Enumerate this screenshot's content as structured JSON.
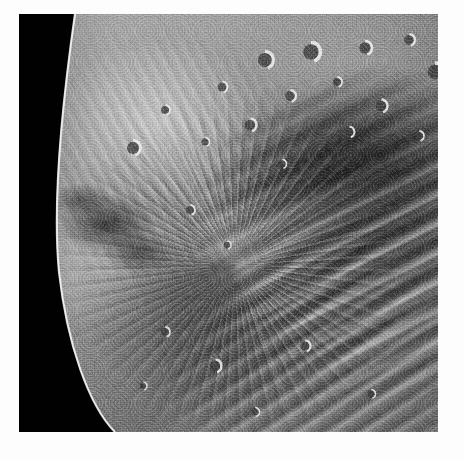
{
  "image": {
    "kind": "natural-image",
    "subject": "Planetary moon surface close-up (grayscale spacecraft photograph)",
    "body_name": "Miranda",
    "caption": "",
    "palette": {
      "space_black": "#080808",
      "terrain_dark": "#2a2a2a",
      "terrain_mid": "#7d7d7d",
      "terrain_light": "#d2d2d2",
      "highlight_white": "#f2f2f2",
      "paper_white": "#fdfdfd"
    },
    "frame": {
      "canvas_width": 464,
      "canvas_height": 460,
      "photo_left": 19,
      "photo_top": 14,
      "photo_width": 419,
      "photo_height": 418,
      "border_color": "#fdfdfd"
    },
    "features": [
      {
        "name": "terminator-limb",
        "description": "Curved bright limb separating sunlit surface from black space along the left edge"
      },
      {
        "name": "cratered-plains",
        "description": "Mottled grey cratered terrain occupying the upper-left and upper-centre"
      },
      {
        "name": "crater-field",
        "description": "Dense field of small bright-rimmed impact craters in the upper-right"
      },
      {
        "name": "chevron-apex",
        "description": "Radial convergence point of grooves and ridges near image centre"
      },
      {
        "name": "grooved-banded-terrain",
        "description": "Alternating dark and bright parallel ridge bands running diagonally across the right and lower-right"
      },
      {
        "name": "bright-band",
        "description": "Prominent bright sweeping band crossing the right side below centre"
      },
      {
        "name": "dark-rubble-patch",
        "description": "Dark broken blocky material along the mid-left near the limb"
      }
    ],
    "craters": [
      {
        "cx": 292,
        "cy": 38,
        "r": 9.5
      },
      {
        "cx": 346,
        "cy": 34,
        "r": 7.0
      },
      {
        "cx": 246,
        "cy": 46,
        "r": 8.5
      },
      {
        "cx": 390,
        "cy": 26,
        "r": 6.0
      },
      {
        "cx": 416,
        "cy": 58,
        "r": 9.0
      },
      {
        "cx": 362,
        "cy": 92,
        "r": 6.5
      },
      {
        "cx": 318,
        "cy": 68,
        "r": 5.0
      },
      {
        "cx": 271,
        "cy": 82,
        "r": 6.0
      },
      {
        "cx": 203,
        "cy": 73,
        "r": 5.5
      },
      {
        "cx": 231,
        "cy": 111,
        "r": 6.5
      },
      {
        "cx": 186,
        "cy": 128,
        "r": 4.5
      },
      {
        "cx": 114,
        "cy": 134,
        "r": 7.5
      },
      {
        "cx": 146,
        "cy": 96,
        "r": 5.0
      },
      {
        "cx": 330,
        "cy": 118,
        "r": 5.5
      },
      {
        "cx": 400,
        "cy": 122,
        "r": 5.0
      },
      {
        "cx": 263,
        "cy": 150,
        "r": 4.5
      },
      {
        "cx": 171,
        "cy": 196,
        "r": 5.0
      },
      {
        "cx": 208,
        "cy": 231,
        "r": 4.0
      },
      {
        "cx": 146,
        "cy": 318,
        "r": 5.0
      },
      {
        "cx": 196,
        "cy": 352,
        "r": 6.5
      },
      {
        "cx": 286,
        "cy": 332,
        "r": 5.5
      },
      {
        "cx": 352,
        "cy": 380,
        "r": 4.5
      },
      {
        "cx": 124,
        "cy": 372,
        "r": 4.0
      },
      {
        "cx": 236,
        "cy": 398,
        "r": 4.5
      }
    ]
  }
}
